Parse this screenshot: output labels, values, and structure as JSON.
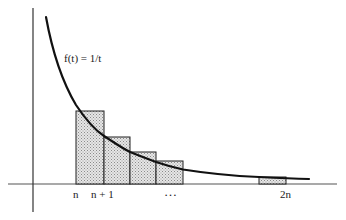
{
  "figure": {
    "function_label": "f(t) = 1/t",
    "x_tick_labels": [
      {
        "text": "n",
        "x": 73
      },
      {
        "text": "n + 1",
        "x": 91
      },
      {
        "text": "…",
        "x": 165
      },
      {
        "text": "2n",
        "x": 280
      }
    ],
    "colors": {
      "curve": "#111111",
      "axis": "#555555",
      "bar_fill": "#d4d4d4",
      "bar_stroke": "#222222"
    },
    "bars": [
      {
        "left": 76,
        "right": 104,
        "top": 111
      },
      {
        "left": 104,
        "right": 130,
        "top": 137
      },
      {
        "left": 130,
        "right": 156,
        "top": 152
      },
      {
        "left": 156,
        "right": 183,
        "top": 161
      },
      {
        "left": 259,
        "right": 286,
        "top": 177
      }
    ],
    "baseline_y": 184
  }
}
